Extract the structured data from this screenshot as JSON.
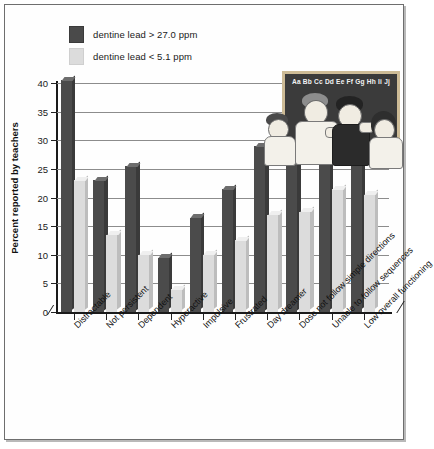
{
  "legend": {
    "items": [
      {
        "label": "dentine lead > 27.0 ppm",
        "swatch": "dark",
        "color": "#4a4a4a"
      },
      {
        "label": "dentine lead < 5.1 ppm",
        "swatch": "light",
        "color": "#dcdcdc"
      }
    ]
  },
  "illustration": {
    "blackboard_text": "Aa Bb Cc Dd Ee Ff Gg Hh Ii Jj",
    "description": "classroom-children"
  },
  "chart_data": {
    "type": "bar",
    "title": "",
    "xlabel": "",
    "ylabel": "Percent reported by teachers",
    "ylim": [
      0,
      40
    ],
    "yticks": [
      0,
      5,
      10,
      15,
      20,
      25,
      30,
      35,
      40
    ],
    "grid": true,
    "legend_position": "top-left",
    "categories": [
      "Distractable",
      "Not persistent",
      "Dependent",
      "Hyperactive",
      "Impulsive",
      "Frustrated",
      "Day dreamer",
      "Dose not follow simple directions",
      "Unable to follow sequences",
      "Low overall functioning"
    ],
    "series": [
      {
        "name": "dentine lead > 27.0 ppm",
        "color": "#4b4b4b",
        "values": [
          40.5,
          23.0,
          25.5,
          9.5,
          16.5,
          21.5,
          29.0,
          29.5,
          33.0,
          31.5
        ]
      },
      {
        "name": "dentine lead < 5.1 ppm",
        "color": "#dcdcdc",
        "values": [
          23.0,
          13.5,
          10.0,
          4.0,
          10.0,
          12.5,
          17.0,
          17.5,
          21.5,
          20.5
        ]
      }
    ]
  }
}
